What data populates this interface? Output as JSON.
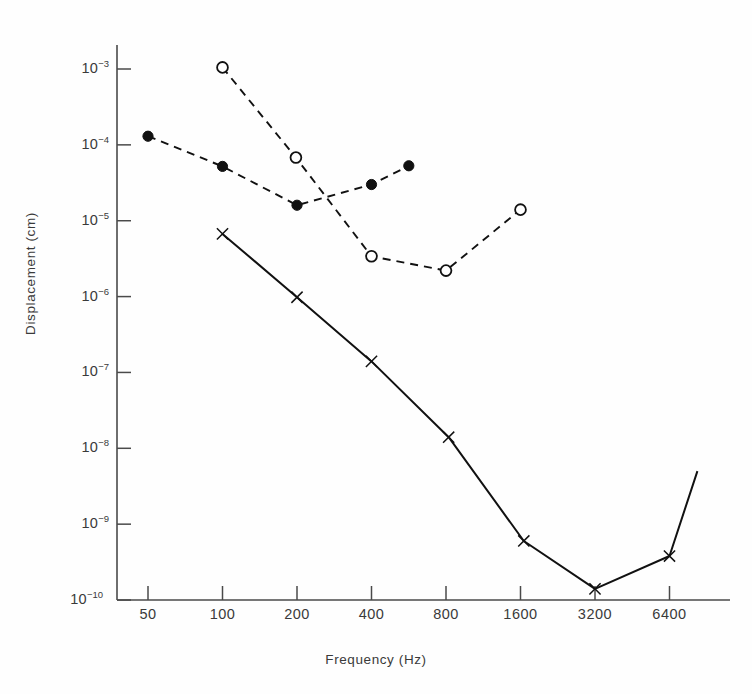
{
  "chart_data": {
    "type": "line",
    "title": "",
    "xlabel": "Frequency (Hz)",
    "ylabel": "Displacement (cm)",
    "xscale": "log2",
    "yscale": "log10",
    "xlim": [
      40,
      9000
    ],
    "ylim": [
      1e-10,
      0.0022
    ],
    "grid": false,
    "legend": "none",
    "x_ticks": [
      {
        "value": 50,
        "label": "50"
      },
      {
        "value": 100,
        "label": "100"
      },
      {
        "value": 200,
        "label": "200"
      },
      {
        "value": 400,
        "label": "400"
      },
      {
        "value": 800,
        "label": "800"
      },
      {
        "value": 1600,
        "label": "1600"
      },
      {
        "value": 3200,
        "label": "3200"
      },
      {
        "value": 6400,
        "label": "6400"
      }
    ],
    "y_ticks": [
      {
        "value": 0.001,
        "mantissa": "10",
        "exponent": "-3"
      },
      {
        "value": 0.0001,
        "mantissa": "10",
        "exponent": "-4"
      },
      {
        "value": 1e-05,
        "mantissa": "10",
        "exponent": "-5"
      },
      {
        "value": 1e-06,
        "mantissa": "10",
        "exponent": "-6"
      },
      {
        "value": 1e-07,
        "mantissa": "10",
        "exponent": "-7"
      },
      {
        "value": 1e-08,
        "mantissa": "10",
        "exponent": "-8"
      },
      {
        "value": 1e-09,
        "mantissa": "10",
        "exponent": "-9"
      },
      {
        "value": 1e-10,
        "mantissa": "10",
        "exponent": "-10"
      }
    ],
    "series": [
      {
        "name": "filled-circle-series",
        "marker": "filled-circle",
        "linestyle": "dashed",
        "color": "#111111",
        "x": [
          50,
          100,
          200,
          400,
          566
        ],
        "y": [
          0.00013,
          5.2e-05,
          1.6e-05,
          3e-05,
          5.3e-05
        ]
      },
      {
        "name": "open-circle-series",
        "marker": "open-circle",
        "linestyle": "dashed",
        "color": "#111111",
        "x": [
          100,
          198,
          400,
          800,
          1600
        ],
        "y": [
          0.00105,
          6.8e-05,
          3.4e-06,
          2.2e-06,
          1.4e-05
        ]
      },
      {
        "name": "cross-marker-series",
        "marker": "cross",
        "linestyle": "solid",
        "color": "#111111",
        "x": [
          100,
          200,
          400,
          820,
          1650,
          3200,
          6400,
          8300
        ],
        "y": [
          6.7e-06,
          9.8e-07,
          1.4e-07,
          1.4e-08,
          6e-10,
          1.4e-10,
          3.8e-10,
          5e-09
        ]
      }
    ]
  },
  "axes": {
    "xlabel": "Frequency (Hz)",
    "ylabel": "Displacement (cm)"
  }
}
